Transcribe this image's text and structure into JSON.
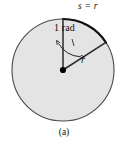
{
  "figure": {
    "caption": "(a)",
    "labels": {
      "arc_length": "s = r",
      "angle": "1 rad",
      "radius": "r"
    },
    "colors": {
      "circle_fill": "#e4e4e4",
      "circle_stroke": "#4a4a4a",
      "arc_stroke": "#111111",
      "radius_stroke": "#2b2b2b",
      "center_dot": "#000000",
      "text": "#111111",
      "background": "#ffffff"
    },
    "geometry": {
      "center_x": 63,
      "center_y": 70,
      "radius": 51,
      "angle_degrees": 57.3,
      "angle_radians": 1,
      "vertical_radius_endpoint_x": 63,
      "vertical_radius_endpoint_y": 19,
      "diagonal_radius_endpoint_x": 106,
      "diagonal_radius_endpoint_y": 42.5
    }
  }
}
